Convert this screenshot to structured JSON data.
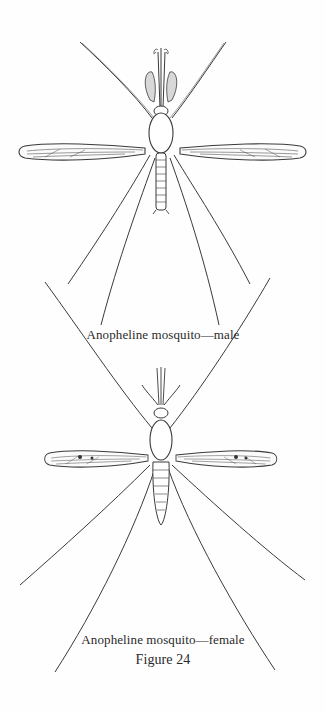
{
  "figure": {
    "label": "Figure 24",
    "plates": [
      {
        "id": "male",
        "caption": "Anopheline mosquito—male"
      },
      {
        "id": "female",
        "caption": "Anopheline mosquito—female"
      }
    ]
  },
  "colors": {
    "ink": "#3a3a3a",
    "paper": "#fefefe"
  }
}
